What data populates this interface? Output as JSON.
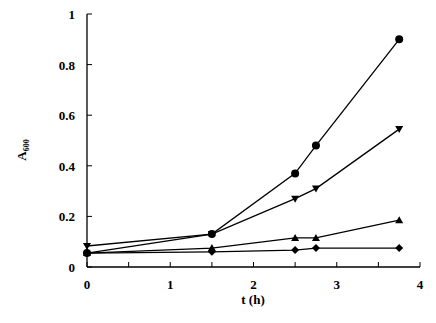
{
  "chart_data": {
    "type": "line",
    "title": "",
    "xlabel": "t (h)",
    "ylabel": "A",
    "ylabel_subscript": "600",
    "xlim": [
      0,
      4
    ],
    "ylim": [
      0,
      1
    ],
    "x_ticks": [
      "0",
      "1",
      "2",
      "3",
      "4"
    ],
    "y_ticks": [
      "0",
      "0.2",
      "0.4",
      "0.6",
      "0.8",
      "1"
    ],
    "grid": false,
    "legend": "none",
    "series": [
      {
        "name": "circle",
        "marker": "circle",
        "x": [
          0,
          1.5,
          2.5,
          2.75,
          3.75
        ],
        "values": [
          0.055,
          0.13,
          0.37,
          0.48,
          0.9
        ]
      },
      {
        "name": "triangle-down",
        "marker": "triangle-down",
        "x": [
          0,
          1.5,
          2.5,
          2.75,
          3.75
        ],
        "values": [
          0.083,
          0.13,
          0.27,
          0.31,
          0.545
        ]
      },
      {
        "name": "triangle-up",
        "marker": "triangle-up",
        "x": [
          0,
          1.5,
          2.5,
          2.75,
          3.75
        ],
        "values": [
          0.055,
          0.075,
          0.115,
          0.115,
          0.185
        ]
      },
      {
        "name": "diamond",
        "marker": "diamond",
        "x": [
          0,
          1.5,
          2.5,
          2.75,
          3.75
        ],
        "values": [
          0.055,
          0.06,
          0.067,
          0.075,
          0.075
        ]
      }
    ]
  }
}
